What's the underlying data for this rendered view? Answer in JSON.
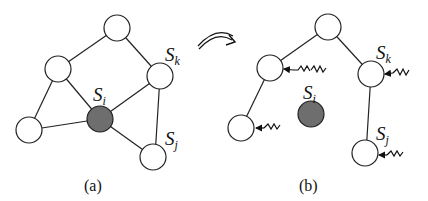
{
  "panels": [
    {
      "caption": "(a)",
      "labels": {
        "si": "S",
        "si_sub": "i",
        "sk": "S",
        "sk_sub": "k",
        "sj": "S",
        "sj_sub": "j"
      }
    },
    {
      "caption": "(b)",
      "labels": {
        "si": "S",
        "si_sub": "i",
        "sk": "S",
        "sk_sub": "k",
        "sj": "S",
        "sj_sub": "j"
      }
    }
  ],
  "colors": {
    "failed_node": "#6e6e6e",
    "line": "#222222",
    "background": "#ffffff"
  },
  "transition_arrow": "curved-double-arrow"
}
